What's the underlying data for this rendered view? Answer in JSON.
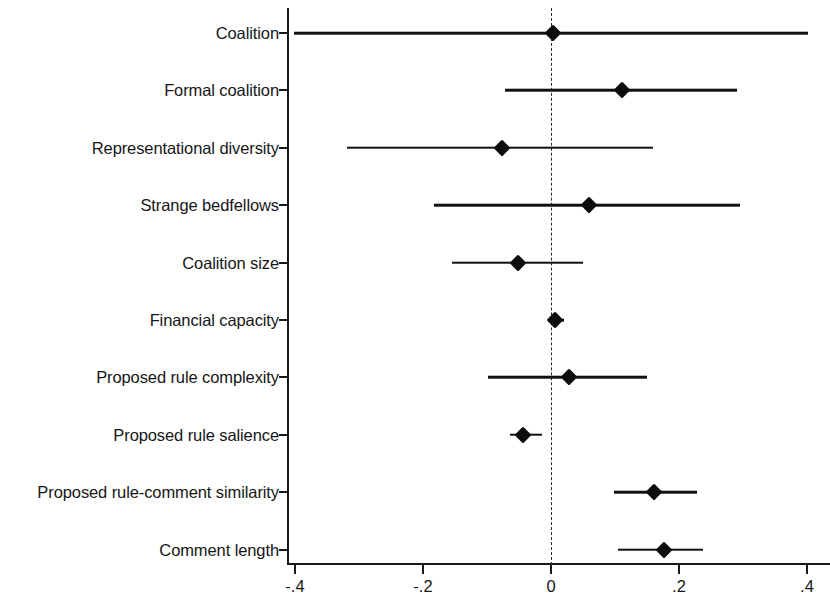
{
  "chart_data": {
    "type": "scatter",
    "subtype": "coefficient-plot",
    "title": "",
    "subtitle": "",
    "xlabel": "",
    "ylabel": "",
    "xlim": [
      -0.4,
      0.4
    ],
    "xticks": [
      -0.4,
      -0.2,
      0,
      0.2,
      0.4
    ],
    "xtick_labels": [
      "-.4",
      "-.2",
      "0",
      ".2",
      ".4"
    ],
    "grid": false,
    "legend": null,
    "reference_line": {
      "x": 0,
      "style": "dashed",
      "color": "#2a2a2a"
    },
    "marker": {
      "shape": "diamond",
      "color": "#0d0d0d"
    },
    "ci_color": "#111111",
    "categories": [
      "Coalition",
      "Formal coalition",
      "Representational diversity",
      "Strange bedfellows",
      "Coalition size",
      "Financial capacity",
      "Proposed rule complexity",
      "Proposed rule salience",
      "Proposed rule-comment similarity",
      "Comment length"
    ],
    "points": [
      {
        "label": "Coalition",
        "estimate": 0.003,
        "ci_low": -0.401,
        "ci_high": 0.401
      },
      {
        "label": "Formal coalition",
        "estimate": 0.111,
        "ci_low": -0.072,
        "ci_high": 0.29
      },
      {
        "label": "Representational diversity",
        "estimate": -0.077,
        "ci_low": -0.319,
        "ci_high": 0.159
      },
      {
        "label": "Strange bedfellows",
        "estimate": 0.059,
        "ci_low": -0.183,
        "ci_high": 0.295
      },
      {
        "label": "Coalition size",
        "estimate": -0.052,
        "ci_low": -0.155,
        "ci_high": 0.05
      },
      {
        "label": "Financial capacity",
        "estimate": 0.006,
        "ci_low": -0.005,
        "ci_high": 0.02
      },
      {
        "label": "Proposed rule complexity",
        "estimate": 0.028,
        "ci_low": -0.098,
        "ci_high": 0.15
      },
      {
        "label": "Proposed rule salience",
        "estimate": -0.044,
        "ci_low": -0.064,
        "ci_high": -0.014
      },
      {
        "label": "Proposed rule-comment similarity",
        "estimate": 0.161,
        "ci_low": 0.098,
        "ci_high": 0.228
      },
      {
        "label": "Comment length",
        "estimate": 0.177,
        "ci_low": 0.105,
        "ci_high": 0.238
      }
    ]
  }
}
